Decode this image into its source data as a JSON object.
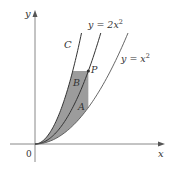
{
  "figure": {
    "axes": {
      "x_label": "x",
      "y_label": "y",
      "origin_label": "0"
    },
    "curves": [
      {
        "id": "C",
        "label": "C",
        "equation": "",
        "relative_coefficient": 4
      },
      {
        "id": "2x2",
        "label": "y = 2x",
        "exponent": "2",
        "relative_coefficient": 2
      },
      {
        "id": "x2",
        "label": "y = x",
        "exponent": "2",
        "relative_coefficient": 1
      }
    ],
    "regions": [
      {
        "id": "A",
        "label": "A",
        "description": "region between y = 2x² and y = x² below P"
      },
      {
        "id": "B",
        "label": "B",
        "description": "region between C and y = 2x² below horizontal through P"
      }
    ],
    "points": [
      {
        "id": "P",
        "label": "P",
        "on_curve": "y = 2x²"
      }
    ],
    "colors": {
      "shade": "#9c9c9c",
      "curve": "#333333",
      "axis": "#888888",
      "background": "#ffffff"
    }
  }
}
